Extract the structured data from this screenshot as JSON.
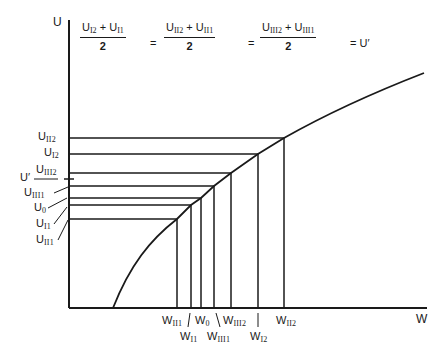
{
  "diagram": {
    "axes": {
      "y_label": "U",
      "x_label": "W"
    },
    "equation": {
      "terms": [
        {
          "numerator_a": "U",
          "sub_a": "I2",
          "op": "+",
          "numerator_b": "U",
          "sub_b": "I1",
          "denominator": "2"
        },
        {
          "numerator_a": "U",
          "sub_a": "II2",
          "op": "+",
          "numerator_b": "U",
          "sub_b": "II1",
          "denominator": "2"
        },
        {
          "numerator_a": "U",
          "sub_a": "III2",
          "op": "+",
          "numerator_b": "U",
          "sub_b": "III1",
          "denominator": "2"
        }
      ],
      "equals": "=",
      "result": "U′"
    },
    "u_levels": [
      {
        "base": "U",
        "sub": "II2",
        "y": 138,
        "x_curve": 284
      },
      {
        "base": "U",
        "sub": "I2",
        "y": 154,
        "x_curve": 258
      },
      {
        "base": "U",
        "sub": "III2",
        "y": 173,
        "x_curve": 231
      },
      {
        "base": "U",
        "sub": "III1",
        "y": 186,
        "x_curve": 214
      },
      {
        "base": "U",
        "sub": "0",
        "y": 198,
        "x_curve": 201
      },
      {
        "base": "U",
        "sub": "I1",
        "y": 205,
        "x_curve": 191
      },
      {
        "base": "U",
        "sub": "II1",
        "y": 219,
        "x_curve": 177
      }
    ],
    "u_prime": {
      "label": "U′",
      "y": 179
    },
    "w_labels": [
      {
        "base": "W",
        "sub": "II1",
        "row": 1
      },
      {
        "base": "W",
        "sub": "I1",
        "row": 2
      },
      {
        "base": "W",
        "sub": "0",
        "row": 1
      },
      {
        "base": "W",
        "sub": "III1",
        "row": 2
      },
      {
        "base": "W",
        "sub": "III2",
        "row": 1
      },
      {
        "base": "W",
        "sub": "I2",
        "row": 2
      },
      {
        "base": "W",
        "sub": "II2",
        "row": 1
      }
    ],
    "curve": {
      "description": "concave increasing utility curve U(W)"
    }
  }
}
